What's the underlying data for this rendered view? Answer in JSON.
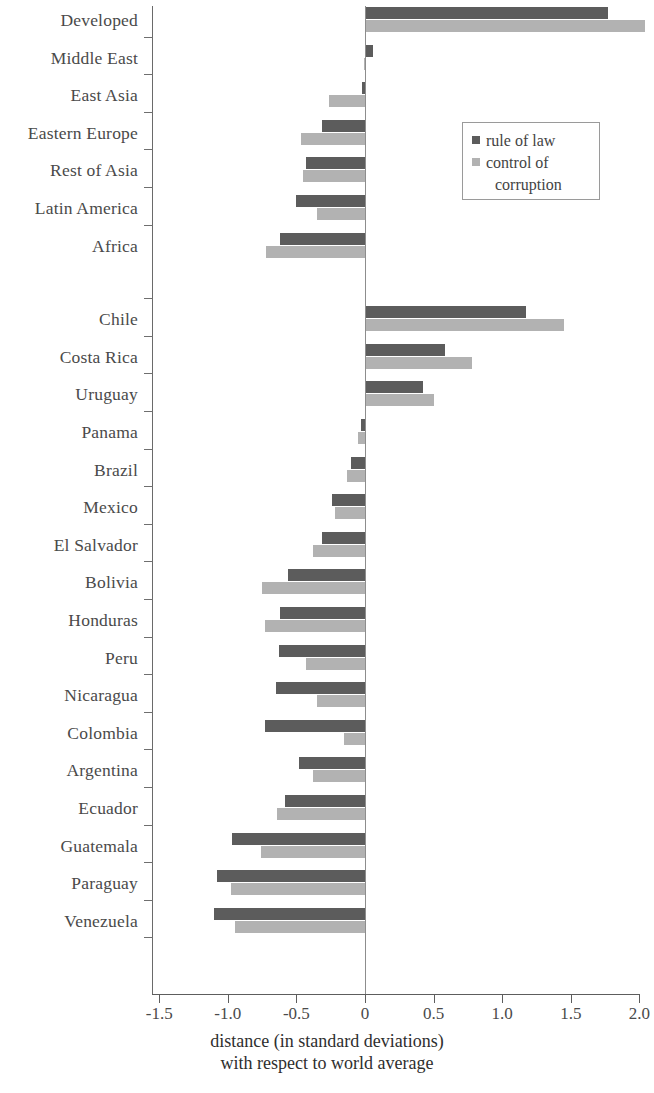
{
  "chart_data": {
    "type": "bar",
    "orientation": "horizontal",
    "title": "",
    "xlabel": "distance (in standard deviations) with respect to world average",
    "xlabel_line1": "distance (in standard deviations)",
    "xlabel_line2": "with respect to world average",
    "ylabel": "",
    "xlim": [
      -1.5,
      2.0
    ],
    "xticks": [
      -1.5,
      -1.0,
      -0.5,
      0,
      0.5,
      1.0,
      1.5,
      2.0
    ],
    "xticklabels": [
      "-1.5",
      "-1.0",
      "-0.5",
      "0",
      "0.5",
      "1.0",
      "1.5",
      "2.0"
    ],
    "grid": false,
    "legend_position": "upper right",
    "colors": {
      "rule_of_law": "#5c5c5c",
      "control_of_corruption": "#b2b2b2"
    },
    "legend": [
      {
        "label": "rule of law",
        "color": "#5c5c5c"
      },
      {
        "label": "control of corruption",
        "color": "#b2b2b2",
        "line1": "control of",
        "line2": "corruption"
      }
    ],
    "series": [
      {
        "name": "rule of law",
        "values": [
          1.77,
          0.06,
          -0.02,
          -0.31,
          -0.43,
          -0.5,
          -0.62,
          1.17,
          0.58,
          0.42,
          -0.03,
          -0.1,
          -0.24,
          -0.31,
          -0.56,
          -0.62,
          -0.63,
          -0.65,
          -0.73,
          -0.48,
          -0.58,
          -0.97,
          -1.08,
          -1.1
        ]
      },
      {
        "name": "control of corruption",
        "values": [
          2.04,
          -0.01,
          -0.26,
          -0.47,
          -0.45,
          -0.35,
          -0.72,
          1.45,
          0.78,
          0.5,
          -0.05,
          -0.13,
          -0.22,
          -0.38,
          -0.75,
          -0.73,
          -0.43,
          -0.35,
          -0.15,
          -0.38,
          -0.64,
          -0.76,
          -0.98,
          -0.95
        ]
      }
    ],
    "groups": [
      {
        "name": "regions",
        "categories": [
          "Developed",
          "Middle East",
          "East Asia",
          "Eastern Europe",
          "Rest of Asia",
          "Latin America",
          "Africa"
        ]
      },
      {
        "name": "countries",
        "categories": [
          "Chile",
          "Costa Rica",
          "Uruguay",
          "Panama",
          "Brazil",
          "Mexico",
          "El Salvador",
          "Bolivia",
          "Honduras",
          "Peru",
          "Nicaragua",
          "Colombia",
          "Argentina",
          "Ecuador",
          "Guatemala",
          "Paraguay",
          "Venezuela"
        ]
      }
    ],
    "categories": [
      "Developed",
      "Middle East",
      "East Asia",
      "Eastern Europe",
      "Rest of Asia",
      "Latin America",
      "Africa",
      "Chile",
      "Costa Rica",
      "Uruguay",
      "Panama",
      "Brazil",
      "Mexico",
      "El Salvador",
      "Bolivia",
      "Honduras",
      "Peru",
      "Nicaragua",
      "Colombia",
      "Argentina",
      "Ecuador",
      "Guatemala",
      "Paraguay",
      "Venezuela"
    ]
  }
}
